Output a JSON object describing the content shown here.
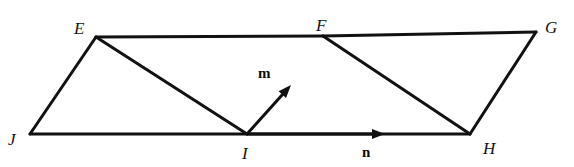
{
  "figure": {
    "type": "geometry-diagram",
    "shape": "parallelogram",
    "width": 574,
    "height": 167,
    "background_color": "#ffffff",
    "stroke_color": "#111111",
    "stroke_width": 3
  },
  "vertices": [
    {
      "id": "E",
      "label": "E",
      "x": 96,
      "y": 37,
      "label_x": 74,
      "label_y": 20
    },
    {
      "id": "F",
      "label": "F",
      "x": 323,
      "y": 36,
      "label_x": 316,
      "label_y": 17
    },
    {
      "id": "G",
      "label": "G",
      "x": 536,
      "y": 32,
      "label_x": 545,
      "label_y": 19
    },
    {
      "id": "J",
      "label": "J",
      "x": 30,
      "y": 134,
      "label_x": 8,
      "label_y": 131
    },
    {
      "id": "I",
      "label": "I",
      "x": 247,
      "y": 134,
      "label_x": 242,
      "label_y": 145
    },
    {
      "id": "H",
      "label": "H",
      "x": 470,
      "y": 134,
      "label_x": 483,
      "label_y": 140
    }
  ],
  "edges": [
    {
      "id": "EF",
      "from": "E",
      "to": "F",
      "role": "top-side"
    },
    {
      "id": "FG",
      "from": "F",
      "to": "G",
      "role": "top-side"
    },
    {
      "id": "JI",
      "from": "J",
      "to": "I",
      "role": "bottom-side"
    },
    {
      "id": "IH",
      "from": "I",
      "to": "H",
      "role": "bottom-side"
    },
    {
      "id": "JE",
      "from": "J",
      "to": "E",
      "role": "left-side"
    },
    {
      "id": "HG",
      "from": "H",
      "to": "G",
      "role": "right-side"
    },
    {
      "id": "EI",
      "from": "E",
      "to": "I",
      "role": "diagonal"
    },
    {
      "id": "FH",
      "from": "F",
      "to": "H",
      "role": "diagonal"
    }
  ],
  "vectors": [
    {
      "id": "m",
      "label": "m",
      "from": "I",
      "to": "F",
      "tail_x": 247,
      "tail_y": 134,
      "tip_x": 291,
      "tip_y": 85,
      "label_x": 258,
      "label_y": 66
    },
    {
      "id": "n",
      "label": "n",
      "from": "I",
      "to": "H",
      "tail_x": 247,
      "tail_y": 134,
      "tip_x": 385,
      "tip_y": 134,
      "label_x": 362,
      "label_y": 145
    }
  ]
}
